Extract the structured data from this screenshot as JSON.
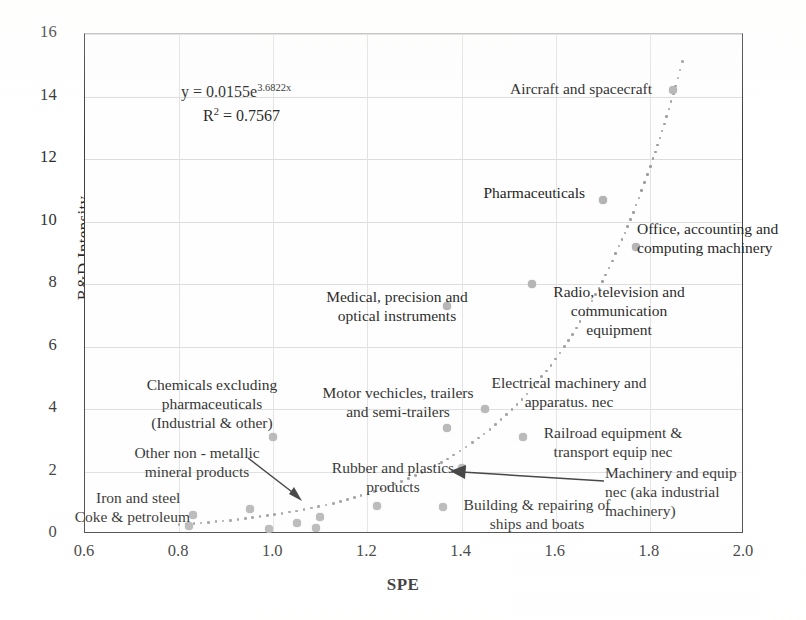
{
  "chart_data": {
    "type": "scatter",
    "title": "",
    "xlabel": "SPE",
    "ylabel": "R&D Intensity",
    "xlim": [
      0.6,
      2.0
    ],
    "ylim": [
      0,
      16
    ],
    "xticks": [
      "0.6",
      "0.8",
      "1.0",
      "1.2",
      "1.4",
      "1.6",
      "1.8",
      "2.0"
    ],
    "yticks": [
      "0",
      "2",
      "4",
      "6",
      "8",
      "10",
      "12",
      "14",
      "16"
    ],
    "grid": true,
    "legend": "none",
    "marker_color": "#b2b2b2",
    "trendline": {
      "type": "exponential",
      "style": "dotted",
      "equation": "y = 0.0155e",
      "equation_exponent": "3.6822x",
      "r2_label": "R",
      "r2_exponent": "2",
      "r2_value": "= 0.7567",
      "coefficient": 0.0155,
      "rate": 3.6822,
      "r_squared": 0.7567
    },
    "points": [
      {
        "label": "Coke & petroleum",
        "x": 0.82,
        "y": 0.25
      },
      {
        "label": "Iron and steel",
        "x": 0.83,
        "y": 0.6
      },
      {
        "label": "Other non - metallic mineral products",
        "x": 0.95,
        "y": 0.8
      },
      {
        "label": "unlabeled-1",
        "x": 0.99,
        "y": 0.15
      },
      {
        "label": "Chemicals excluding pharmaceuticals (Industrial & other)",
        "x": 1.0,
        "y": 3.1
      },
      {
        "label": "unlabeled-2",
        "x": 1.05,
        "y": 0.35
      },
      {
        "label": "unlabeled-3",
        "x": 1.09,
        "y": 0.2
      },
      {
        "label": "unlabeled-4",
        "x": 1.1,
        "y": 0.55
      },
      {
        "label": "Rubber and plastics products",
        "x": 1.22,
        "y": 0.9
      },
      {
        "label": "Building & repairing of ships and boats",
        "x": 1.36,
        "y": 0.85
      },
      {
        "label": "Medical, precision and optical instruments",
        "x": 1.37,
        "y": 7.3
      },
      {
        "label": "Motor vechicles, trailers and semi-trailers",
        "x": 1.37,
        "y": 3.4
      },
      {
        "label": "Machinery and equip nec (aka industrial machinery)",
        "x": 1.4,
        "y": 2.1
      },
      {
        "label": "Electrical machinery and apparatus. nec",
        "x": 1.45,
        "y": 4.0
      },
      {
        "label": "Railroad equipment & transport equip nec",
        "x": 1.53,
        "y": 3.1
      },
      {
        "label": "Radio, television and communication equipment",
        "x": 1.55,
        "y": 8.0
      },
      {
        "label": "Pharmaceuticals",
        "x": 1.7,
        "y": 10.7
      },
      {
        "label": "Office, accounting and computing machinery",
        "x": 1.77,
        "y": 9.2
      },
      {
        "label": "Aircraft and spacecraft",
        "x": 1.85,
        "y": 14.2
      }
    ]
  },
  "annotations": {
    "aircraft": "Aircraft and spacecraft",
    "pharmaceuticals": "Pharmaceuticals",
    "office_line1": "Office, accounting and",
    "office_line2": "computing machinery",
    "radio_line1": "Radio, television and",
    "radio_line2": "communication",
    "radio_line3": "equipment",
    "medical_line1": "Medical, precision and",
    "medical_line2": "optical instruments",
    "chemicals_line1": "Chemicals excluding",
    "chemicals_line2": "pharmaceuticals",
    "chemicals_line3": "(Industrial & other)",
    "motor_line1": "Motor vechicles, trailers",
    "motor_line2": "and semi-trailers",
    "electrical_line1": "Electrical machinery and",
    "electrical_line2": "apparatus. nec",
    "railroad_line1": "Railroad equipment &",
    "railroad_line2": "transport equip nec",
    "machinery_line1": "Machinery and equip",
    "machinery_line2": "nec (aka industrial",
    "machinery_line3": "machinery)",
    "rubber_line1": "Rubber and plastics",
    "rubber_line2": "products",
    "building_line1": "Building & repairing of",
    "building_line2": "ships and boats",
    "othernonmetallic_line1": "Other non - metallic",
    "othernonmetallic_line2": "mineral products",
    "ironsteel": "Iron and steel",
    "coke": "Coke & petroleum"
  }
}
